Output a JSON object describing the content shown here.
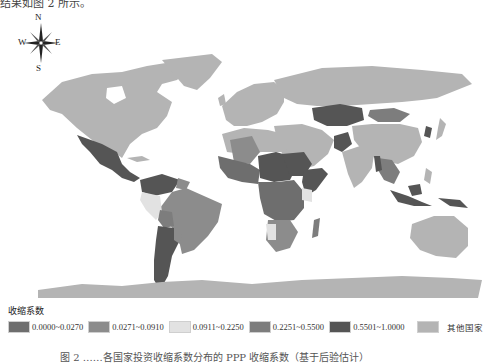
{
  "header": {
    "partial_text": "结果如图 2 所示。"
  },
  "compass": {
    "n": "N",
    "s": "S",
    "e": "E",
    "w": "W"
  },
  "legend": {
    "title": "收缩系数",
    "items": [
      {
        "label": "0.0000~0.0270",
        "color": "#6e6e6e"
      },
      {
        "label": "0.0271~0.0910",
        "color": "#8c8c8c"
      },
      {
        "label": "0.0911~0.2250",
        "color": "#e2e2e2"
      },
      {
        "label": "0.2251~0.5500",
        "color": "#7d7d7d"
      },
      {
        "label": "0.5501~1.0000",
        "color": "#555555"
      },
      {
        "label": "其他国家",
        "color": "#b4b4b4"
      }
    ]
  },
  "caption": {
    "text": "图 2 ……各国家投资收缩系数分布的 PPP 收缩系数（基于后验估计）"
  },
  "colors": {
    "other": "#b4b4b4",
    "c1": "#6e6e6e",
    "c2": "#8c8c8c",
    "c3": "#e2e2e2",
    "c4": "#7d7d7d",
    "c5": "#555555"
  }
}
